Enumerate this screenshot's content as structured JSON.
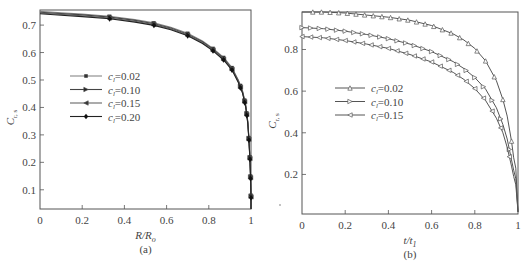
{
  "chart_data": [
    {
      "type": "line",
      "panel_caption": "(a)",
      "xlabel": "R/R_o",
      "ylabel": "C_{r,s}",
      "xlim": [
        0,
        1
      ],
      "ylim": [
        0.03,
        0.755
      ],
      "xticks": [
        "0",
        "0.2",
        "0.4",
        "0.6",
        "0.8",
        "1"
      ],
      "yticks": [
        "0.1",
        "0.2",
        "0.3",
        "0.4",
        "0.5",
        "0.6",
        "0.7"
      ],
      "legend": [
        "c_l=0.02",
        "c_l=0.10",
        "c_l=0.15",
        "c_l=0.20"
      ],
      "legend_position": "upper-left-middle",
      "grid": false,
      "x": [
        0,
        0.1,
        0.2,
        0.33,
        0.45,
        0.54,
        0.62,
        0.7,
        0.77,
        0.82,
        0.87,
        0.91,
        0.94,
        0.96,
        0.975,
        0.985,
        0.99,
        0.995,
        0.998,
        1.0,
        1.0
      ],
      "series": [
        {
          "name": "c_l=0.02",
          "marker": "square",
          "values": [
            0.75,
            0.745,
            0.74,
            0.732,
            0.72,
            0.708,
            0.692,
            0.67,
            0.642,
            0.615,
            0.582,
            0.545,
            0.5,
            0.46,
            0.41,
            0.35,
            0.29,
            0.22,
            0.15,
            0.08,
            0.03
          ]
        },
        {
          "name": "c_l=0.10",
          "marker": "right-triangle",
          "values": [
            0.747,
            0.742,
            0.737,
            0.729,
            0.717,
            0.705,
            0.689,
            0.667,
            0.639,
            0.612,
            0.579,
            0.542,
            0.497,
            0.457,
            0.407,
            0.347,
            0.287,
            0.217,
            0.147,
            0.077,
            0.03
          ]
        },
        {
          "name": "c_l=0.15",
          "marker": "left-triangle",
          "values": [
            0.744,
            0.739,
            0.734,
            0.726,
            0.714,
            0.702,
            0.686,
            0.664,
            0.636,
            0.609,
            0.576,
            0.539,
            0.494,
            0.454,
            0.404,
            0.344,
            0.284,
            0.214,
            0.144,
            0.074,
            0.03
          ]
        },
        {
          "name": "c_l=0.20",
          "marker": "diamond",
          "values": [
            0.741,
            0.736,
            0.731,
            0.723,
            0.711,
            0.699,
            0.683,
            0.661,
            0.633,
            0.606,
            0.573,
            0.536,
            0.491,
            0.451,
            0.401,
            0.341,
            0.281,
            0.211,
            0.141,
            0.071,
            0.03
          ]
        }
      ]
    },
    {
      "type": "line",
      "panel_caption": "(b)",
      "xlabel": "t/t_1",
      "ylabel": "C_{r,s}",
      "xlim": [
        0,
        1
      ],
      "ylim": [
        0.01,
        0.98
      ],
      "xticks": [
        "0",
        "0.2",
        "0.4",
        "0.6",
        "0.8",
        "1"
      ],
      "yticks": [
        "0.2",
        "0.4",
        "0.6",
        "0.8"
      ],
      "legend": [
        "c_l=0.02",
        "c_l=0.10",
        "c_l=0.15"
      ],
      "legend_position": "middle-left",
      "grid": false,
      "x": [
        0,
        0.1,
        0.2,
        0.3,
        0.4,
        0.5,
        0.6,
        0.7,
        0.75,
        0.8,
        0.85,
        0.9,
        0.93,
        0.95,
        0.97,
        0.98,
        0.99,
        1.0
      ],
      "series": [
        {
          "name": "c_l=0.02",
          "marker": "up-triangle",
          "values": [
            0.98,
            0.98,
            0.975,
            0.965,
            0.955,
            0.94,
            0.915,
            0.875,
            0.845,
            0.805,
            0.745,
            0.65,
            0.56,
            0.48,
            0.36,
            0.28,
            0.23,
            0.02
          ]
        },
        {
          "name": "c_l=0.10",
          "marker": "right-triangle",
          "values": [
            0.905,
            0.9,
            0.888,
            0.872,
            0.852,
            0.826,
            0.79,
            0.742,
            0.708,
            0.665,
            0.61,
            0.52,
            0.44,
            0.37,
            0.27,
            0.22,
            0.18,
            0.02
          ]
        },
        {
          "name": "c_l=0.15",
          "marker": "left-triangle",
          "values": [
            0.862,
            0.856,
            0.843,
            0.826,
            0.805,
            0.776,
            0.74,
            0.69,
            0.656,
            0.612,
            0.555,
            0.47,
            0.4,
            0.33,
            0.24,
            0.19,
            0.15,
            0.02
          ]
        }
      ]
    }
  ],
  "panels": {
    "a": {
      "caption": "(a)",
      "xlabel_main": "R/R",
      "xlabel_sub": "o",
      "ylabel_main": "C",
      "ylabel_sub": "r, s",
      "legend_labels": [
        "c",
        "c",
        "c",
        "c"
      ],
      "legend_values": [
        "=0.02",
        "=0.10",
        "=0.15",
        "=0.20"
      ],
      "legend_sub": "l"
    },
    "b": {
      "caption": "(b)",
      "xlabel_main": "t/t",
      "xlabel_sub": "1",
      "ylabel_main": "C",
      "ylabel_sub": "r, s",
      "legend_values": [
        "=0.02",
        "=0.10",
        "=0.15"
      ],
      "legend_sub": "l"
    }
  }
}
